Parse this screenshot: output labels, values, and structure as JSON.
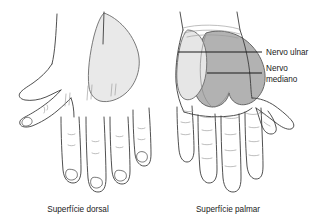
{
  "figure": {
    "title_visible": false,
    "background_color": "#ffffff",
    "ink_color": "#3c3c3c",
    "captions": [
      {
        "id": "dorsal",
        "text": "Superfície dorsal",
        "x": 78,
        "y": 211
      },
      {
        "id": "palmar",
        "text": "Superfície palmar",
        "x": 228,
        "y": 211
      }
    ],
    "labels": [
      {
        "id": "nervo-ulnar",
        "text": "Nervo ulnar",
        "x": 266,
        "y": 54,
        "lines": [
          "Nervo ulnar"
        ],
        "leader": {
          "x1": 178,
          "y1": 52,
          "x2": 262,
          "y2": 52
        }
      },
      {
        "id": "nervo-mediano",
        "text": "Nervo mediano",
        "x": 266,
        "y": 73,
        "lines": [
          "Nervo",
          "mediano"
        ],
        "leader": {
          "x1": 207,
          "y1": 73,
          "x2": 262,
          "y2": 73
        }
      }
    ],
    "regions": [
      {
        "id": "dorsal-shaded",
        "name": "dorsal-sensory-territory",
        "hand": "dorsal",
        "fill": "#e9e9e9",
        "stroke": "#6b6b6b"
      },
      {
        "id": "palmar-ulnar-shaded",
        "name": "ulnar-nerve-territory",
        "hand": "palmar",
        "fill": "#e6e6e6",
        "stroke": "#6b6b6b"
      },
      {
        "id": "palmar-median-shaded",
        "name": "median-nerve-territory",
        "hand": "palmar",
        "fill": "#b2b2b2",
        "stroke": "#5a5a5a"
      }
    ],
    "hands": [
      {
        "id": "dorsal",
        "name": "dorsal-hand",
        "fingers": 4,
        "thumb_side": "left",
        "nails": true
      },
      {
        "id": "palmar",
        "name": "palmar-hand",
        "fingers": 4,
        "thumb_side": "right",
        "nails": false
      }
    ]
  }
}
